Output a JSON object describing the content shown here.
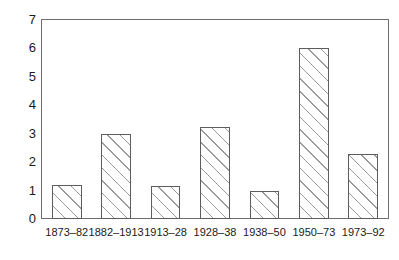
{
  "chart_data": {
    "type": "bar",
    "title": "",
    "subtitle": "",
    "xlabel": "",
    "ylabel": "",
    "categories": [
      "1873–82",
      "1882–1913",
      "1913–28",
      "1928–38",
      "1938–50",
      "1950–73",
      "1973–92"
    ],
    "values": [
      1.2,
      3.0,
      1.15,
      3.25,
      1.0,
      6.0,
      2.3
    ],
    "ylim": [
      0,
      7
    ],
    "ytick_labels": [
      "0",
      "1",
      "2",
      "3",
      "4",
      "5",
      "6",
      "7"
    ],
    "ytick_values": [
      0,
      1,
      2,
      3,
      4,
      5,
      6,
      7
    ],
    "grid": false,
    "legend": null,
    "legend_position": "none",
    "bar_fill": "diagonal-hatch",
    "bar_fill_color": "#ffffff",
    "bar_hatch_color": "#9a9a9a",
    "bar_border_color": "#5d5d5d",
    "frame_color": "#6e6e6e",
    "background_color": "#ffffff"
  }
}
